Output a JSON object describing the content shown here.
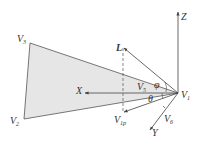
{
  "diagram": {
    "type": "geometry-vector-diagram",
    "colors": {
      "fill": "#e6e6e6",
      "stroke": "#555555",
      "text": "#333333"
    },
    "points": {
      "V1": [
        178,
        93
      ],
      "V2": [
        24,
        119
      ],
      "V3": [
        30,
        43
      ],
      "L_tip": [
        123,
        47
      ],
      "V1p": [
        123,
        113
      ],
      "X_tip": [
        85,
        93
      ],
      "Z_tip": [
        178,
        12
      ],
      "Y_tip": [
        150,
        130
      ]
    },
    "labels": {
      "Z": {
        "main": "Z",
        "sub": ""
      },
      "L": {
        "main": "L",
        "sub": ""
      },
      "V3": {
        "main": "V",
        "sub": "3"
      },
      "V2": {
        "main": "V",
        "sub": "2"
      },
      "V1": {
        "main": "V",
        "sub": "1"
      },
      "X": {
        "main": "X",
        "sub": ""
      },
      "V5": {
        "main": "V",
        "sub": "5"
      },
      "phi": {
        "main": "φ",
        "sub": ""
      },
      "theta": {
        "main": "θ",
        "sub": ""
      },
      "V1p": {
        "main": "V",
        "sub": "1p"
      },
      "V6": {
        "main": "V",
        "sub": "6"
      },
      "Y": {
        "main": "Y",
        "sub": ""
      }
    }
  }
}
